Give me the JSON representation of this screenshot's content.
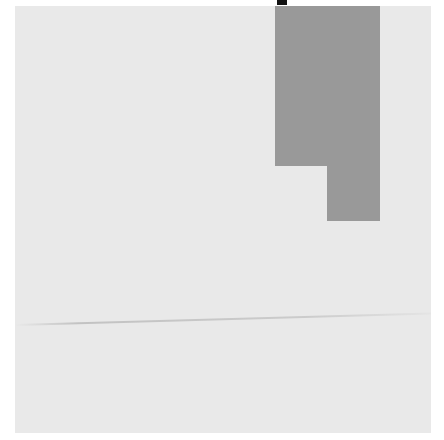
{
  "board": {
    "background": "#e9e9e9",
    "x": 15,
    "y": 6,
    "width": 416,
    "height": 427
  },
  "piece": {
    "shape": "L",
    "color": "#999999",
    "parts": [
      {
        "x": 260,
        "y": 0,
        "width": 105,
        "height": 160
      },
      {
        "x": 312,
        "y": 160,
        "width": 53,
        "height": 55
      }
    ]
  },
  "marker": {
    "color": "#111111"
  }
}
